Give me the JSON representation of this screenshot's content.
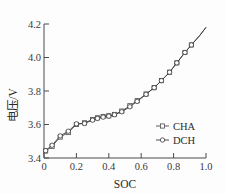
{
  "chart_data": {
    "type": "line",
    "title": "",
    "xlabel": "SOC",
    "ylabel": "电压/V",
    "xlim": [
      0.0,
      1.0
    ],
    "ylim": [
      3.4,
      4.2
    ],
    "xticks": [
      0,
      0.2,
      0.4,
      0.6,
      0.8,
      1.0
    ],
    "xtick_labels": [
      "0",
      "0.2",
      "0.4",
      "0.6",
      "0.8",
      "1.0"
    ],
    "yticks": [
      3.4,
      3.6,
      3.8,
      4.0,
      4.2
    ],
    "ytick_labels": [
      "3.4",
      "3.6",
      "3.8",
      "4.0",
      "4.2"
    ],
    "grid": false,
    "legend_position": "lower-right",
    "series": [
      {
        "name": "CHA",
        "marker": "square",
        "color": "#4a4a4a",
        "x": [
          0.01,
          0.05,
          0.1,
          0.15,
          0.2,
          0.25,
          0.3,
          0.33,
          0.365,
          0.4,
          0.435,
          0.48,
          0.53,
          0.575,
          0.63,
          0.68,
          0.725,
          0.775,
          0.82,
          0.87,
          0.91,
          0.96,
          1.0
        ],
        "y": [
          3.442,
          3.47,
          3.525,
          3.552,
          3.6,
          3.61,
          3.63,
          3.64,
          3.648,
          3.652,
          3.66,
          3.68,
          3.712,
          3.742,
          3.782,
          3.82,
          3.862,
          3.912,
          3.968,
          4.03,
          4.075,
          4.13,
          4.18
        ]
      },
      {
        "name": "DCH",
        "marker": "circle",
        "color": "#3a3a3a",
        "x": [
          0.01,
          0.05,
          0.1,
          0.15,
          0.2,
          0.25,
          0.3,
          0.33,
          0.365,
          0.4,
          0.435,
          0.48,
          0.53,
          0.575,
          0.63,
          0.68,
          0.725,
          0.775,
          0.82,
          0.87,
          0.91,
          0.96,
          1.0
        ],
        "y": [
          3.444,
          3.476,
          3.532,
          3.56,
          3.604,
          3.606,
          3.626,
          3.636,
          3.644,
          3.65,
          3.658,
          3.676,
          3.706,
          3.738,
          3.78,
          3.82,
          3.862,
          3.912,
          3.968,
          4.03,
          4.075,
          4.13,
          4.18
        ]
      }
    ]
  },
  "legend": {
    "entries": [
      {
        "label": "CHA",
        "marker": "square-marker-icon"
      },
      {
        "label": "DCH",
        "marker": "circle-marker-icon"
      }
    ]
  },
  "axes": {
    "x_title": "SOC",
    "y_title": "电压/V"
  },
  "colors": {
    "axis": "#4a4a4a",
    "cha": "#4a4a4a",
    "dch": "#3a3a3a",
    "background": "#fdfdfd"
  }
}
